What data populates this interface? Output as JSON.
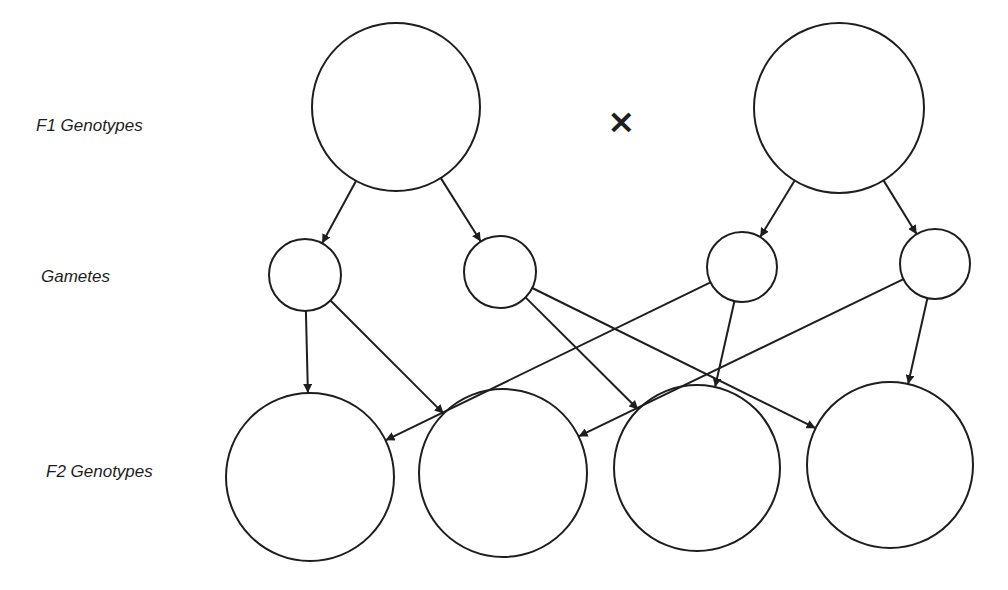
{
  "labels": {
    "f1": "F1  Genotypes",
    "gametes": "Gametes",
    "f2": "F2  Genotypes"
  },
  "cross_symbol": "×",
  "colors": {
    "stroke": "#1e1e1e",
    "background": "#ffffff"
  },
  "nodes": {
    "f1": [
      {
        "id": "f1-left",
        "cx": 396,
        "cy": 107,
        "r": 84
      },
      {
        "id": "f1-right",
        "cx": 839,
        "cy": 108,
        "r": 85
      }
    ],
    "gametes": [
      {
        "id": "g1",
        "cx": 305,
        "cy": 275,
        "r": 36
      },
      {
        "id": "g2",
        "cx": 500,
        "cy": 272,
        "r": 36
      },
      {
        "id": "g3",
        "cx": 742,
        "cy": 267,
        "r": 35
      },
      {
        "id": "g4",
        "cx": 935,
        "cy": 264,
        "r": 35
      }
    ],
    "f2": [
      {
        "id": "f2-a",
        "cx": 310,
        "cy": 477,
        "r": 84
      },
      {
        "id": "f2-b",
        "cx": 503,
        "cy": 473,
        "r": 84
      },
      {
        "id": "f2-c",
        "cx": 697,
        "cy": 468,
        "r": 83
      },
      {
        "id": "f2-d",
        "cx": 890,
        "cy": 465,
        "r": 83
      }
    ]
  },
  "edges": [
    {
      "from": "f1-left",
      "to": "g1"
    },
    {
      "from": "f1-left",
      "to": "g2"
    },
    {
      "from": "f1-right",
      "to": "g3"
    },
    {
      "from": "f1-right",
      "to": "g4"
    },
    {
      "from": "g1",
      "to": "f2-a"
    },
    {
      "from": "g1",
      "to": "f2-b"
    },
    {
      "from": "g2",
      "to": "f2-c"
    },
    {
      "from": "g2",
      "to": "f2-d"
    },
    {
      "from": "g3",
      "to": "f2-a"
    },
    {
      "from": "g3",
      "to": "f2-c"
    },
    {
      "from": "g4",
      "to": "f2-b"
    },
    {
      "from": "g4",
      "to": "f2-d"
    }
  ]
}
